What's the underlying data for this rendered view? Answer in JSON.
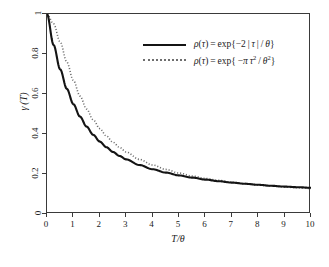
{
  "figure": {
    "background": "#ffffff",
    "frame_color": "#3a3a3a"
  },
  "axes": {
    "xlabel": "T/θ",
    "ylabel": "γ (T)",
    "xticks": [
      "0",
      "1",
      "2",
      "3",
      "4",
      "5",
      "6",
      "7",
      "8",
      "9",
      "10"
    ],
    "yticks": [
      "0",
      "0.2",
      "0.4",
      "0.6",
      "0.8",
      "1"
    ]
  },
  "legend": {
    "entries": [
      {
        "key": "solid-line",
        "color": "#141414",
        "style": "solid",
        "label_plain": "ρ(τ) = exp{−2 | τ | / θ}",
        "lhs": "ρ(τ) = exp{−2 | τ | / ",
        "theta": "θ",
        "close": "}"
      },
      {
        "key": "dotted-line",
        "color": "#6e6e6e",
        "style": "dotted",
        "label_plain": "ρ(τ) = exp{ −π τ² / θ² }",
        "lhs": "ρ(τ) = exp{ −π τ",
        "sup1": "2",
        "mid": " / ",
        "theta": "θ",
        "sup2": "2",
        "close": "}"
      }
    ]
  },
  "caption": {
    "text": ""
  },
  "chart_data": {
    "type": "line",
    "title": "",
    "xlabel": "T/θ",
    "ylabel": "γ (T)",
    "xlim": [
      0,
      10
    ],
    "ylim": [
      0,
      1
    ],
    "xticks": [
      0,
      1,
      2,
      3,
      4,
      5,
      6,
      7,
      8,
      9,
      10
    ],
    "yticks": [
      0,
      0.2,
      0.4,
      0.6,
      0.8,
      1
    ],
    "grid": false,
    "legend_position": "upper right",
    "series": [
      {
        "name": "ρ(τ) = exp{−2 | τ | / θ}",
        "style": "solid",
        "color": "#141414",
        "x": [
          0,
          0.25,
          0.5,
          0.75,
          1,
          1.25,
          1.5,
          1.75,
          2,
          2.25,
          2.5,
          2.75,
          3,
          3.5,
          4,
          4.5,
          5,
          5.5,
          6,
          6.5,
          7,
          7.5,
          8,
          8.5,
          9,
          9.5,
          10
        ],
        "y": [
          1.0,
          0.845,
          0.723,
          0.626,
          0.549,
          0.487,
          0.437,
          0.396,
          0.362,
          0.334,
          0.31,
          0.29,
          0.273,
          0.245,
          0.224,
          0.207,
          0.193,
          0.182,
          0.172,
          0.164,
          0.157,
          0.151,
          0.146,
          0.141,
          0.137,
          0.134,
          0.131
        ]
      },
      {
        "name": "ρ(τ) = exp{ −π τ² / θ² }",
        "style": "dotted",
        "color": "#6e6e6e",
        "x": [
          0,
          0.25,
          0.5,
          0.75,
          1,
          1.25,
          1.5,
          1.75,
          2,
          2.25,
          2.5,
          2.75,
          3,
          3.5,
          4,
          4.5,
          5,
          5.5,
          6,
          6.5,
          7,
          7.5,
          8,
          8.5,
          9,
          9.5,
          10
        ],
        "y": [
          1.0,
          0.951,
          0.86,
          0.76,
          0.668,
          0.59,
          0.525,
          0.471,
          0.427,
          0.39,
          0.359,
          0.333,
          0.31,
          0.273,
          0.245,
          0.223,
          0.205,
          0.19,
          0.178,
          0.168,
          0.159,
          0.152,
          0.145,
          0.14,
          0.135,
          0.131,
          0.127
        ]
      }
    ]
  }
}
